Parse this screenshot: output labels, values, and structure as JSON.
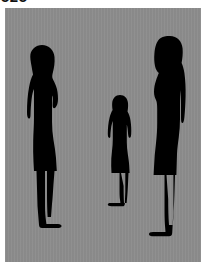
{
  "image": {
    "caption_clipped": "525",
    "panel": {
      "background_color": "#8c8c8c",
      "silhouette_color": "#000000",
      "page_background_color": "#ffffff"
    }
  },
  "figures": [
    {
      "id": "adult-left",
      "name": "adult-woman-left",
      "description": "Adult woman silhouette in side profile, long hair, wearing a dress, standing upright",
      "facing": "right",
      "relative_height": "tall",
      "position": {
        "x": 13,
        "y": 36,
        "width": 52,
        "height": 185
      }
    },
    {
      "id": "child",
      "name": "child-center",
      "description": "Child silhouette in side profile, ponytail, wearing a dress, standing upright",
      "facing": "left",
      "relative_height": "short",
      "position": {
        "x": 98,
        "y": 86,
        "width": 34,
        "height": 113
      }
    },
    {
      "id": "adult-right",
      "name": "adult-woman-right",
      "description": "Adult woman silhouette in side profile, long hair down the back, wearing a dress, standing upright",
      "facing": "left",
      "relative_height": "tallest",
      "position": {
        "x": 138,
        "y": 27,
        "width": 50,
        "height": 204
      }
    }
  ]
}
